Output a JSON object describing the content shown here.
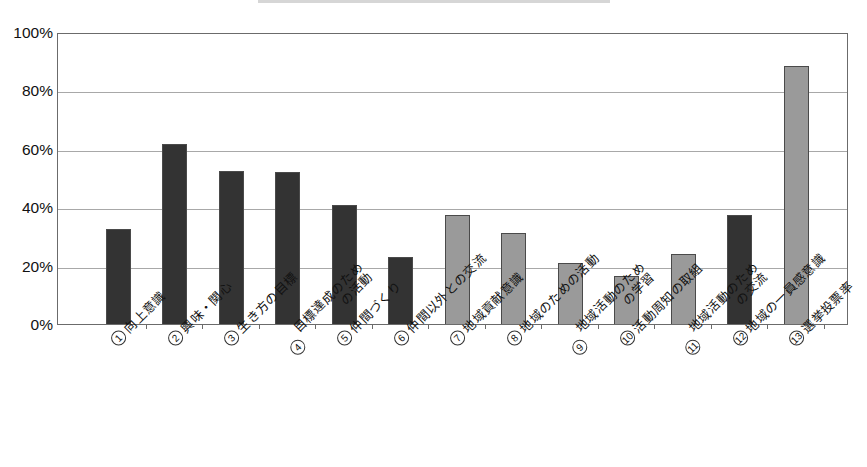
{
  "axis": {
    "y_ticks": [
      "0%",
      "20%",
      "40%",
      "60%",
      "80%",
      "100%"
    ],
    "y_min": 0,
    "y_max": 100
  },
  "categories": [
    {
      "num": "①",
      "line1": "向上意識",
      "line2": ""
    },
    {
      "num": "②",
      "line1": "興味・関心",
      "line2": ""
    },
    {
      "num": "③",
      "line1": "生き方の目標",
      "line2": ""
    },
    {
      "num": "④",
      "line1": "目標達成のため",
      "line2": "の活動"
    },
    {
      "num": "⑤",
      "line1": "仲間づくり",
      "line2": ""
    },
    {
      "num": "⑥",
      "line1": "仲間以外との交流",
      "line2": ""
    },
    {
      "num": "⑦",
      "line1": "地域貢献意識",
      "line2": ""
    },
    {
      "num": "⑧",
      "line1": "地域のための活動",
      "line2": ""
    },
    {
      "num": "⑨",
      "line1": "地域活動のため",
      "line2": "の学習"
    },
    {
      "num": "⑩",
      "line1": "活動周知の取組",
      "line2": ""
    },
    {
      "num": "⑪",
      "line1": "地域活動のため",
      "line2": "の交流"
    },
    {
      "num": "⑫",
      "line1": "地域の一員感意識",
      "line2": ""
    },
    {
      "num": "⑬",
      "line1": "選挙投票率",
      "line2": ""
    }
  ],
  "colors": {
    "dark": "#333333",
    "light": "#9a9a9a",
    "grid": "#a8a8a8",
    "frame": "#6b6b6b"
  },
  "chart_data": {
    "type": "bar",
    "title": "",
    "xlabel": "",
    "ylabel": "",
    "ylim": [
      0,
      100
    ],
    "grid": true,
    "legend": "none",
    "categories": [
      "① 向上意識",
      "② 興味・関心",
      "③ 生き方の目標",
      "④ 目標達成のための活動",
      "⑤ 仲間づくり",
      "⑥ 仲間以外との交流",
      "⑦ 地域貢献意識",
      "⑧ 地域のための活動",
      "⑨ 地域活動のための学習",
      "⑩ 活動周知の取組",
      "⑪ 地域活動のための交流",
      "⑫ 地域の一員感意識",
      "⑬ 選挙投票率"
    ],
    "values": [
      32.5,
      61.5,
      52.5,
      52.0,
      40.8,
      23.0,
      37.5,
      31.0,
      21.0,
      16.5,
      24.0,
      37.5,
      88.5
    ],
    "bar_styles": [
      "dark",
      "dark",
      "dark",
      "dark",
      "dark",
      "dark",
      "light",
      "light",
      "light",
      "light",
      "light",
      "dark",
      "light"
    ],
    "tick_labels": [
      "0%",
      "20%",
      "40%",
      "60%",
      "80%",
      "100%"
    ]
  }
}
